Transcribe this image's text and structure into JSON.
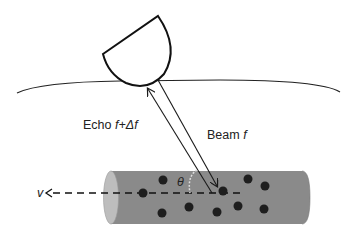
{
  "diagram": {
    "labels": {
      "echo_prefix": "Echo ",
      "echo_freq": "f+Δf",
      "beam_prefix": "Beam ",
      "beam_freq": "f",
      "angle": "θ",
      "velocity": "v"
    },
    "elements": {
      "transducer": "ultrasound-probe",
      "skin": "skin-surface-curve",
      "vessel": "blood-vessel-cylinder",
      "particles": "red-blood-cells",
      "flow_axis": "dashed-flow-arrow"
    },
    "colors": {
      "vessel_fill": "#8a8a8a",
      "vessel_end": "#b9b9b9",
      "particle": "#1e1e1e",
      "line": "#1a1a1a"
    }
  }
}
